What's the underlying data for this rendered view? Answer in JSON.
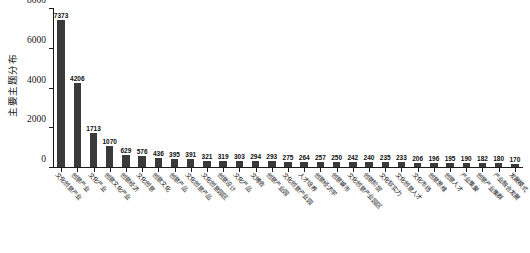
{
  "chart_data": {
    "type": "bar",
    "title": "",
    "xlabel": "",
    "ylabel": "主要主题分布",
    "ylim": [
      0,
      8000
    ],
    "yticks": [
      0,
      2000,
      4000,
      6000,
      8000
    ],
    "ytick_labels": [
      "0",
      "2000",
      "4000",
      "6000",
      "8000"
    ],
    "grid": false,
    "legend": false,
    "bar_color": "#3a3a3a",
    "orientation": "vertical",
    "categories": [
      "文化创意产业",
      "创意产业",
      "文化产业",
      "创意文化产业",
      "创意经济",
      "文化创意",
      "创意文化",
      "创意产品",
      "文化创意产品",
      "文化创意园区",
      "创意设计",
      "文化产品",
      "文博会",
      "创意产业园",
      "文化创意产业园",
      "人才培养",
      "创意经济学",
      "创意城市",
      "文化创意产业园区",
      "创意阶层",
      "文化软实力",
      "文化创意人才",
      "文化市场",
      "创意思维",
      "创意人才",
      "产业集聚",
      "创意产业集群",
      "产业融合发展",
      "发展模式"
    ],
    "values": [
      7373,
      4206,
      1713,
      1070,
      629,
      576,
      436,
      395,
      391,
      321,
      319,
      303,
      294,
      293,
      275,
      264,
      257,
      250,
      242,
      240,
      235,
      233,
      206,
      196,
      195,
      190,
      182,
      180,
      170
    ],
    "value_labels": [
      "7373",
      "4206",
      "1713",
      "1070",
      "629",
      "576",
      "436",
      "395",
      "391",
      "321",
      "319",
      "303",
      "294",
      "293",
      "275",
      "264",
      "257",
      "250",
      "242",
      "240",
      "235",
      "233",
      "206",
      "196",
      "195",
      "190",
      "182",
      "180",
      "170"
    ]
  }
}
